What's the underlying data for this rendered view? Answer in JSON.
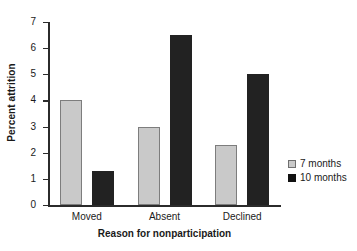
{
  "chart_data": {
    "type": "bar",
    "title": "",
    "xlabel": "Reason for nonparticipation",
    "ylabel": "Percent attrition",
    "categories": [
      "Moved",
      "Absent",
      "Declined"
    ],
    "series": [
      {
        "name": "7 months",
        "values": [
          4.0,
          3.0,
          2.3
        ],
        "color": "#c9c9c9"
      },
      {
        "name": "10 months",
        "values": [
          1.3,
          6.5,
          5.0
        ],
        "color": "#222222"
      }
    ],
    "ylim": [
      0,
      7
    ],
    "yticks": [
      0,
      1,
      2,
      3,
      4,
      5,
      6,
      7
    ],
    "ytick_labels": [
      "0",
      "1",
      "2",
      "3",
      "4",
      "5",
      "6",
      "7"
    ],
    "grid": false,
    "legend_position": "right"
  },
  "legend": {
    "items": [
      {
        "label": "7 months",
        "swatch": "light-gray-square"
      },
      {
        "label": "10 months",
        "swatch": "black-square"
      }
    ]
  },
  "axes": {
    "y_title": "Percent attrition",
    "x_title": "Reason for nonparticipation"
  },
  "colors": {
    "series_7_months": "#c9c9c9",
    "series_10_months": "#222222",
    "axis": "#2b2b2b",
    "background": "#ffffff"
  }
}
